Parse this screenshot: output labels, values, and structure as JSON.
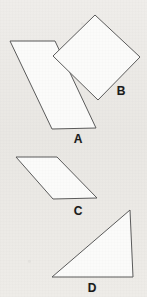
{
  "page": {
    "background_color": "#eceae6",
    "width": 147,
    "height": 297
  },
  "style": {
    "shape_fill": "#fbfbfa",
    "shape_stroke": "#5b5b5b",
    "label_color": "#1b1b1b"
  },
  "shapes": [
    {
      "id": "shape-a",
      "label": "A",
      "kind": "parallelogram",
      "points": "10,41 52,129 96,128 55,41",
      "label_x": 78,
      "label_y": 139
    },
    {
      "id": "shape-b",
      "label": "B",
      "kind": "square-rotated",
      "points": "95,15 140,57 98,100 53,56",
      "label_x": 121,
      "label_y": 91
    },
    {
      "id": "shape-c",
      "label": "C",
      "kind": "parallelogram",
      "points": "16,157 57,157 97,198 53,199",
      "label_x": 78,
      "label_y": 211
    },
    {
      "id": "shape-d",
      "label": "D",
      "kind": "right-triangle",
      "points": "130,210 133,277 52,277",
      "label_x": 92,
      "label_y": 288
    }
  ]
}
